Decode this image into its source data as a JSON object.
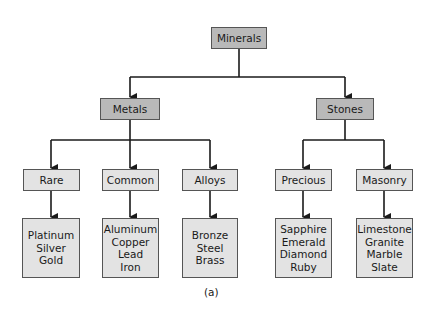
{
  "diagram": {
    "type": "hierarchy-tree",
    "root": {
      "id": "minerals",
      "label": "Minerals"
    },
    "level1": [
      {
        "id": "metals",
        "label": "Metals",
        "parent": "minerals"
      },
      {
        "id": "stones",
        "label": "Stones",
        "parent": "minerals"
      }
    ],
    "level2": [
      {
        "id": "rare",
        "label": "Rare",
        "parent": "metals"
      },
      {
        "id": "common",
        "label": "Common",
        "parent": "metals"
      },
      {
        "id": "alloys",
        "label": "Alloys",
        "parent": "metals"
      },
      {
        "id": "precious",
        "label": "Precious",
        "parent": "stones"
      },
      {
        "id": "masonry",
        "label": "Masonry",
        "parent": "stones"
      }
    ],
    "leaves": [
      {
        "id": "rare-items",
        "parent": "rare",
        "items": [
          "Platinum",
          "Silver",
          "Gold"
        ]
      },
      {
        "id": "common-items",
        "parent": "common",
        "items": [
          "Aluminum",
          "Copper",
          "Lead",
          "Iron"
        ]
      },
      {
        "id": "alloys-items",
        "parent": "alloys",
        "items": [
          "Bronze",
          "Steel",
          "Brass"
        ]
      },
      {
        "id": "precious-items",
        "parent": "precious",
        "items": [
          "Sapphire",
          "Emerald",
          "Diamond",
          "Ruby"
        ]
      },
      {
        "id": "masonry-items",
        "parent": "masonry",
        "items": [
          "Limestone",
          "Granite",
          "Marble",
          "Slate"
        ]
      }
    ],
    "caption": "(a)",
    "colors": {
      "dark_box": "#b9b9b9",
      "light_box": "#e3e3e3",
      "line": "#1a1a1a"
    }
  }
}
